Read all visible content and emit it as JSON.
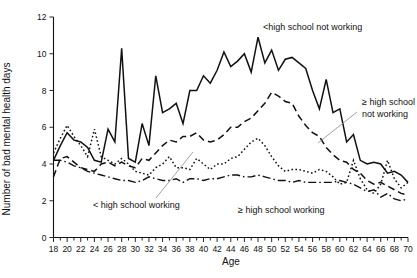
{
  "chart_data": {
    "type": "line",
    "title": "",
    "xlabel": "Age",
    "ylabel": "Number of bad mental health days",
    "xlim": [
      18,
      70
    ],
    "ylim": [
      0,
      12
    ],
    "grid": false,
    "legend_position": "inline-annotations",
    "x_tick_step": 2,
    "x_minor_tick_step": 1,
    "y_tick_step": 2,
    "x_tick_labels": [
      "18",
      "20",
      "22",
      "24",
      "26",
      "28",
      "30",
      "32",
      "34",
      "36",
      "38",
      "40",
      "42",
      "44",
      "46",
      "48",
      "50",
      "52",
      "54",
      "56",
      "58",
      "60",
      "62",
      "64",
      "66",
      "68",
      "70"
    ],
    "y_tick_labels": [
      "0",
      "2",
      "4",
      "6",
      "8",
      "10",
      "12"
    ],
    "x": [
      18,
      19,
      20,
      21,
      22,
      23,
      24,
      25,
      26,
      27,
      28,
      29,
      30,
      31,
      32,
      33,
      34,
      35,
      36,
      37,
      38,
      39,
      40,
      41,
      42,
      43,
      44,
      45,
      46,
      47,
      48,
      49,
      50,
      51,
      52,
      53,
      54,
      55,
      56,
      57,
      58,
      59,
      60,
      61,
      62,
      63,
      64,
      65,
      66,
      67,
      68,
      69,
      70
    ],
    "series": [
      {
        "name": "<high school not working",
        "style": "solid",
        "annotation": "<high school not working",
        "values": [
          4.2,
          5.0,
          5.7,
          5.3,
          5.2,
          4.9,
          4.2,
          4.1,
          5.9,
          5.2,
          10.3,
          4.3,
          4.1,
          6.2,
          5.0,
          8.8,
          6.8,
          7.0,
          7.3,
          6.2,
          8.0,
          8.0,
          8.8,
          8.4,
          9.1,
          10.1,
          9.3,
          9.6,
          10.0,
          9.0,
          10.9,
          9.5,
          10.2,
          9.1,
          9.7,
          9.8,
          9.5,
          9.2,
          8.0,
          7.0,
          8.6,
          6.8,
          7.0,
          5.2,
          5.6,
          4.2,
          4.0,
          4.1,
          4.0,
          3.5,
          3.6,
          3.4,
          3.0
        ]
      },
      {
        "name": "≥ high school not working",
        "style": "dashed",
        "annotation": "≥ high school not working",
        "values": [
          3.3,
          4.3,
          4.4,
          4.1,
          3.8,
          3.7,
          3.6,
          4.0,
          4.1,
          3.9,
          4.1,
          3.9,
          3.8,
          4.3,
          4.2,
          4.6,
          5.0,
          5.3,
          5.2,
          5.5,
          5.5,
          5.7,
          5.3,
          5.2,
          5.3,
          5.6,
          6.0,
          6.0,
          6.3,
          6.5,
          6.9,
          7.3,
          7.9,
          7.7,
          7.4,
          7.3,
          6.6,
          6.1,
          5.7,
          5.5,
          4.9,
          4.5,
          4.2,
          4.1,
          3.7,
          3.5,
          3.1,
          2.9,
          3.0,
          2.8,
          2.6,
          2.4,
          2.3
        ]
      },
      {
        "name": "< high school working",
        "style": "dotted",
        "annotation": "< high school working",
        "values": [
          4.6,
          5.4,
          6.1,
          5.5,
          5.0,
          4.4,
          5.9,
          4.4,
          4.2,
          4.0,
          4.3,
          4.0,
          3.6,
          3.5,
          3.4,
          3.8,
          4.0,
          4.4,
          3.8,
          3.8,
          3.7,
          4.3,
          4.0,
          3.7,
          4.0,
          4.0,
          4.3,
          4.4,
          4.8,
          5.2,
          5.4,
          5.0,
          4.4,
          3.9,
          3.6,
          3.7,
          3.7,
          3.6,
          3.5,
          3.7,
          3.6,
          3.3,
          2.9,
          3.0,
          4.2,
          3.2,
          2.6,
          2.4,
          2.9,
          4.2,
          3.2,
          2.7,
          3.0
        ]
      },
      {
        "name": "≥ high school working",
        "style": "dashdot",
        "annotation": "≥ high school working",
        "values": [
          4.2,
          4.2,
          4.1,
          3.9,
          3.8,
          3.6,
          3.5,
          3.4,
          3.3,
          3.2,
          3.1,
          3.1,
          3.0,
          3.1,
          3.3,
          3.2,
          3.1,
          3.1,
          3.2,
          3.0,
          3.2,
          3.2,
          3.1,
          3.2,
          3.2,
          3.3,
          3.4,
          3.4,
          3.3,
          3.3,
          3.4,
          3.3,
          3.2,
          3.1,
          3.1,
          3.0,
          3.1,
          3.0,
          3.0,
          3.0,
          3.0,
          3.0,
          3.1,
          3.0,
          2.9,
          2.7,
          2.5,
          2.6,
          2.2,
          2.4,
          2.1,
          2.0,
          2.1
        ]
      }
    ]
  },
  "annotations": {
    "lt_hs_not_working": "<high school not working",
    "gte_hs_not_working_line1": "≥ high school",
    "gte_hs_not_working_line2": "not working",
    "lt_hs_working": "< high school working",
    "gte_hs_working": "≥ high school working"
  }
}
